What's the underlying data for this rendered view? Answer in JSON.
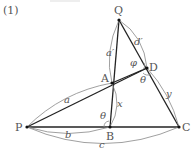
{
  "problem_label": "(1)",
  "points": {
    "Q": {
      "label": "Q",
      "x": 119,
      "y": 20
    },
    "P": {
      "label": "P",
      "x": 27,
      "y": 127
    },
    "A": {
      "label": "A",
      "x": 112,
      "y": 83
    },
    "D": {
      "label": "D",
      "x": 147,
      "y": 68
    },
    "B": {
      "label": "B",
      "x": 110,
      "y": 127
    },
    "C": {
      "label": "C",
      "x": 179,
      "y": 127
    }
  },
  "lengths": {
    "a": "a",
    "a_prime": "a′",
    "b": "b",
    "c": "c",
    "d_prime": "d′",
    "x": "x",
    "y": "y"
  },
  "angles": {
    "theta_B": "θ",
    "theta_D": "θ",
    "phi_D": "φ"
  },
  "colors": {
    "line": "#222222",
    "arc": "#888888",
    "text": "#555555"
  }
}
